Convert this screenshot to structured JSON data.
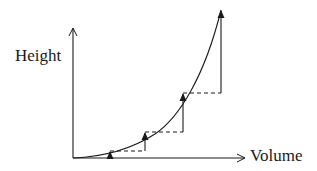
{
  "diagram": {
    "type": "step-approximation-curve",
    "y_axis_label": "Height",
    "x_axis_label": "Volume",
    "curve": "increasing convex curve (height vs volume), starting at origin",
    "steps": [
      {
        "x": 110,
        "y_from": 158,
        "y_to": 151
      },
      {
        "x": 145,
        "y_from": 151,
        "y_to": 132
      },
      {
        "x": 183,
        "y_from": 132,
        "y_to": 93
      },
      {
        "x": 221,
        "y_from": 93,
        "y_to": 10
      }
    ],
    "dashed_segments": [
      {
        "y": 151,
        "x_from": 110,
        "x_to": 145
      },
      {
        "y": 132,
        "x_from": 145,
        "x_to": 183
      },
      {
        "y": 93,
        "x_from": 183,
        "x_to": 221
      }
    ],
    "colors": {
      "stroke": "#1a1a1a",
      "background": "#ffffff"
    }
  }
}
